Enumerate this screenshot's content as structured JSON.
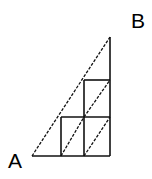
{
  "diagram": {
    "type": "geometry-grid-path",
    "labels": {
      "start": "A",
      "end": "B"
    },
    "points": {
      "A": [
        32,
        156
      ],
      "B": [
        110,
        37
      ],
      "bottom_right": [
        110,
        156
      ]
    },
    "grid": {
      "verticals_x": [
        61,
        84,
        110
      ],
      "horizontals_y": [
        80,
        117,
        156
      ]
    },
    "colors": {
      "line": "#111111",
      "background": "#ffffff"
    }
  }
}
